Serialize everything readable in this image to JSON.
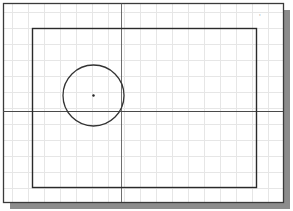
{
  "drawing": {
    "background": "#ffffff",
    "grid": {
      "color": "#e6e6e6",
      "spacing": 16,
      "offset_x": 9,
      "offset_y": 12
    },
    "sheet": {
      "x": 3,
      "y": 3,
      "width": 280,
      "height": 199,
      "stroke": "#3a3a3a",
      "shadow_color": "#8c8c8c",
      "shadow_offset": 7
    },
    "inner_rectangle": {
      "x": 32,
      "y": 28,
      "width": 224,
      "height": 159,
      "stroke": "#2a2a2a"
    },
    "axes": {
      "horizontal_y": 111,
      "vertical_x": 121,
      "stroke": "#4a4a4a"
    },
    "circle": {
      "cx": 93.5,
      "cy": 95.5,
      "r": 30.5,
      "stroke": "#333333"
    },
    "center_point": {
      "x": 93,
      "y": 95,
      "r": 1.2,
      "fill": "#222222"
    },
    "corner_marker": {
      "x": 259,
      "y": 20,
      "glyph": "'",
      "color": "#bdbdbd"
    }
  }
}
